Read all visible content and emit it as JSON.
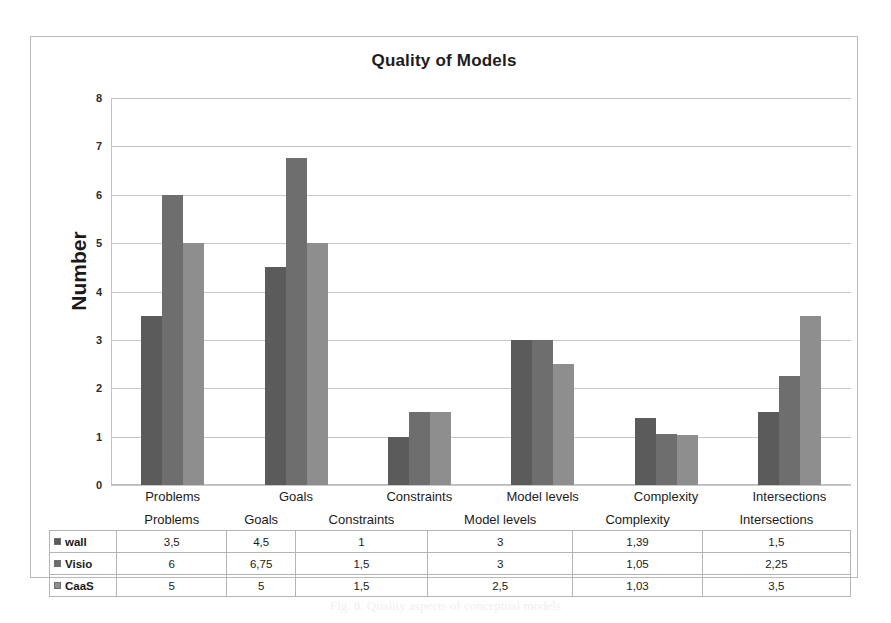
{
  "figure": {
    "caption": "Fig. 8. Quality aspects of conceptual models"
  },
  "chart_data": {
    "type": "bar",
    "title": "Quality of Models",
    "xlabel": "",
    "ylabel": "Number",
    "ylim": [
      0,
      8
    ],
    "ytick_labels": [
      "0",
      "1",
      "2",
      "3",
      "4",
      "5",
      "6",
      "7",
      "8"
    ],
    "grid": true,
    "legend_position": "table-below",
    "categories": [
      "Problems",
      "Goals",
      "Constraints",
      "Model levels",
      "Complexity",
      "Intersections"
    ],
    "series": [
      {
        "name": "wall",
        "color": "#5b5b5b",
        "values": [
          3.5,
          4.5,
          1,
          3,
          1.39,
          1.5
        ],
        "labels": [
          "3,5",
          "4,5",
          "1",
          "3",
          "1,39",
          "1,5"
        ]
      },
      {
        "name": "Visio",
        "color": "#6e6e6e",
        "values": [
          6,
          6.75,
          1.5,
          3,
          1.05,
          2.25
        ],
        "labels": [
          "6",
          "6,75",
          "1,5",
          "3",
          "1,05",
          "2,25"
        ]
      },
      {
        "name": "CaaS",
        "color": "#8e8e8e",
        "values": [
          5,
          5,
          1.5,
          2.5,
          1.03,
          3.5
        ],
        "labels": [
          "5",
          "5",
          "1,5",
          "2,5",
          "1,03",
          "3,5"
        ]
      }
    ]
  }
}
